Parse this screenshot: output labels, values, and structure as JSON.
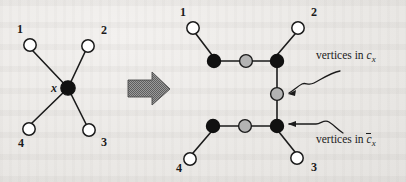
{
  "figure": {
    "background_color": "#eeecea",
    "ink_color": "#1b1b1b",
    "node_fill_white": "#ffffff",
    "node_fill_black": "#111111",
    "node_fill_gray": "#b3b3b3",
    "arrow_fill": "#8a8a8a"
  },
  "left_graph": {
    "name": "original-star-graph",
    "center_label": "x",
    "leaf_labels": [
      "1",
      "2",
      "3",
      "4"
    ],
    "nodes": [
      {
        "id": "L1",
        "label": "1",
        "kind": "white",
        "cx": 30,
        "cy": 45
      },
      {
        "id": "L2",
        "label": "2",
        "kind": "white",
        "cx": 88,
        "cy": 46
      },
      {
        "id": "L3",
        "label": "3",
        "kind": "white",
        "cx": 89,
        "cy": 130
      },
      {
        "id": "L4",
        "label": "4",
        "kind": "white",
        "cx": 29,
        "cy": 129
      },
      {
        "id": "LX",
        "label": "x",
        "kind": "black",
        "cx": 68,
        "cy": 88
      }
    ],
    "node_label_positions": [
      {
        "text": "1",
        "x": 17,
        "y": 29
      },
      {
        "text": "2",
        "x": 101,
        "y": 30
      },
      {
        "text": "3",
        "x": 101,
        "y": 139
      },
      {
        "text": "4",
        "x": 18,
        "y": 140
      },
      {
        "text": "x",
        "x": 52,
        "y": 83
      }
    ],
    "edges": [
      [
        "LX",
        "L1"
      ],
      [
        "LX",
        "L2"
      ],
      [
        "LX",
        "L3"
      ],
      [
        "LX",
        "L4"
      ]
    ]
  },
  "transform_arrow": {
    "name": "transform-arrow",
    "direction": "right"
  },
  "right_graph": {
    "name": "transformed-gadget-graph",
    "leaf_labels": [
      "1",
      "2",
      "3",
      "4"
    ],
    "nodes": [
      {
        "id": "R1",
        "label": "1",
        "kind": "white",
        "cx": 193,
        "cy": 28
      },
      {
        "id": "R2",
        "label": "2",
        "kind": "white",
        "cx": 298,
        "cy": 28
      },
      {
        "id": "R3",
        "label": "3",
        "kind": "white",
        "cx": 297,
        "cy": 158
      },
      {
        "id": "R4",
        "label": "4",
        "kind": "white",
        "cx": 190,
        "cy": 159
      },
      {
        "id": "TA",
        "label": "",
        "kind": "black",
        "cx": 214,
        "cy": 61
      },
      {
        "id": "TM",
        "label": "",
        "kind": "gray",
        "cx": 246,
        "cy": 61
      },
      {
        "id": "TB",
        "label": "",
        "kind": "black",
        "cx": 277,
        "cy": 61
      },
      {
        "id": "MID",
        "label": "",
        "kind": "gray",
        "cx": 277,
        "cy": 94
      },
      {
        "id": "BB",
        "label": "",
        "kind": "black",
        "cx": 277,
        "cy": 126
      },
      {
        "id": "BM",
        "label": "",
        "kind": "gray",
        "cx": 245,
        "cy": 126
      },
      {
        "id": "BA",
        "label": "",
        "kind": "black",
        "cx": 213,
        "cy": 126
      }
    ],
    "node_label_positions": [
      {
        "text": "1",
        "x": 180,
        "y": 12
      },
      {
        "text": "2",
        "x": 311,
        "y": 12
      },
      {
        "text": "3",
        "x": 310,
        "y": 166
      },
      {
        "text": "4",
        "x": 176,
        "y": 167
      }
    ],
    "edges": [
      [
        "R1",
        "TA"
      ],
      [
        "TA",
        "TM"
      ],
      [
        "TM",
        "TB"
      ],
      [
        "TB",
        "R2"
      ],
      [
        "TB",
        "MID"
      ],
      [
        "MID",
        "BB"
      ],
      [
        "BB",
        "BM"
      ],
      [
        "BM",
        "BA"
      ],
      [
        "BA",
        "R4"
      ],
      [
        "BB",
        "R3"
      ]
    ]
  },
  "callouts": [
    {
      "name": "callout-vertices-in-cx",
      "text_prefix": "vertices in",
      "symbol": "c",
      "subscript": "x",
      "overbar": false,
      "text_x": 316,
      "text_y": 56,
      "arrow_tip": {
        "x": 288,
        "y": 94
      }
    },
    {
      "name": "callout-vertices-in-cx-bar",
      "text_prefix": "vertices in",
      "symbol": "c",
      "subscript": "x",
      "overbar": true,
      "text_x": 316,
      "text_y": 140,
      "arrow_tip": {
        "x": 288,
        "y": 124
      }
    }
  ]
}
